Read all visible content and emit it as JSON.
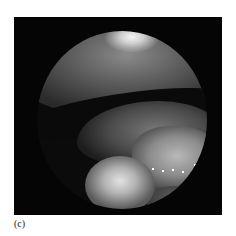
{
  "figure": {
    "caption_label": "(c)",
    "colors": {
      "background": "#ffffff",
      "frame": "#050505",
      "highlight": "#f4f4f4"
    }
  }
}
